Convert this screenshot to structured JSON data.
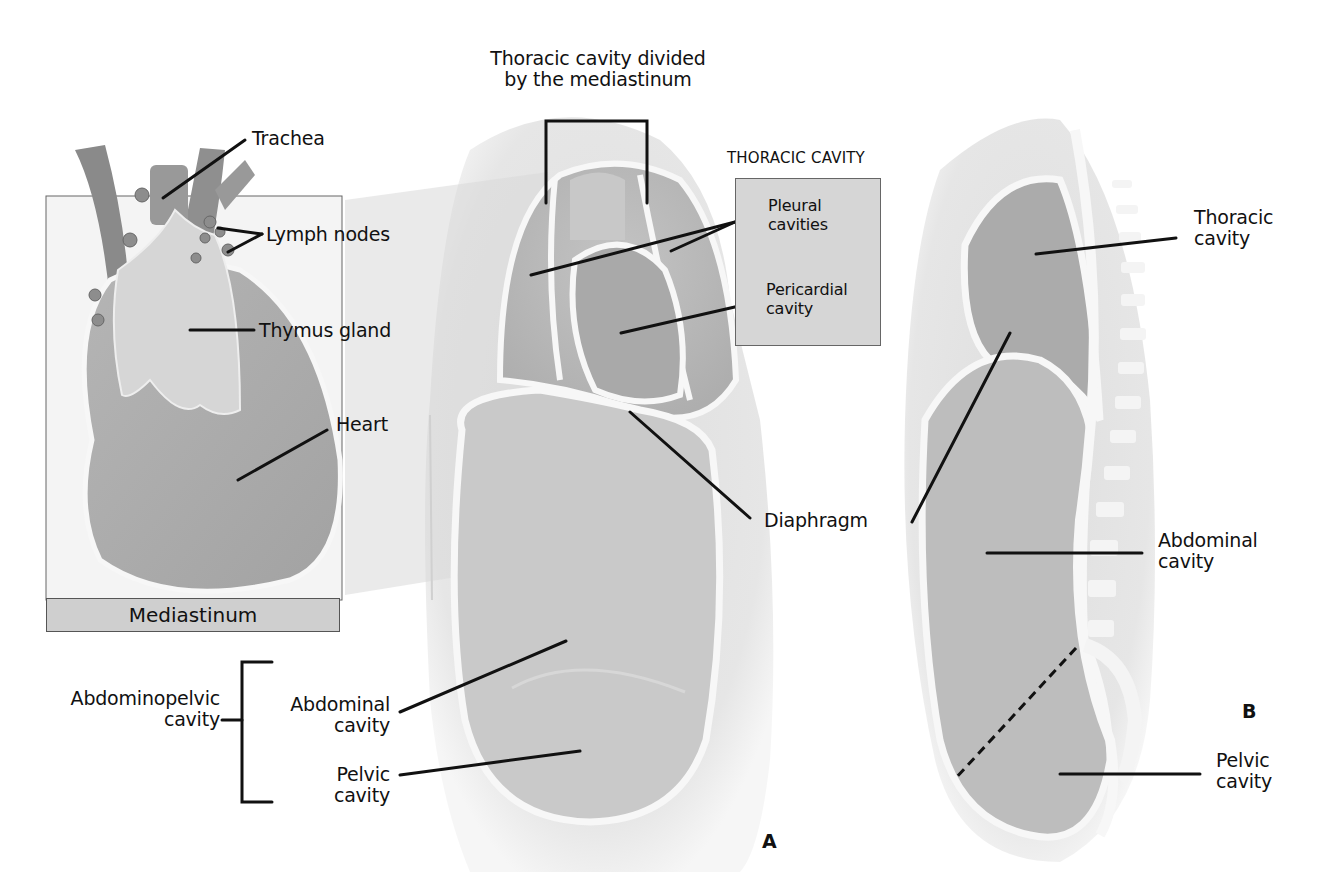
{
  "figure": {
    "panel_a_letter": "A",
    "panel_b_letter": "B"
  },
  "mediastinum_inset": {
    "labels": {
      "trachea": "Trachea",
      "lymph_nodes": "Lymph nodes",
      "thymus_gland": "Thymus gland",
      "heart": "Heart"
    },
    "footer_bar": "Mediastinum"
  },
  "panel_a": {
    "top_caption_line1": "Thoracic cavity divided",
    "top_caption_line2": "by the mediastinum",
    "thoracic_box_title": "THORACIC CAVITY",
    "pleural_line1": "Pleural",
    "pleural_line2": "cavities",
    "pericardial_line1": "Pericardial",
    "pericardial_line2": "cavity",
    "diaphragm": "Diaphragm",
    "abdominopelvic_line1": "Abdominopelvic",
    "abdominopelvic_line2": "cavity",
    "abdominal_line1": "Abdominal",
    "abdominal_line2": "cavity",
    "pelvic_line1": "Pelvic",
    "pelvic_line2": "cavity"
  },
  "panel_b": {
    "thoracic_line1": "Thoracic",
    "thoracic_line2": "cavity",
    "abdominal_line1": "Abdominal",
    "abdominal_line2": "cavity",
    "pelvic_line1": "Pelvic",
    "pelvic_line2": "cavity"
  },
  "colors": {
    "background": "#ffffff",
    "body_fill": "#e4e4e4",
    "cavity_fill": "#b9b9b9",
    "cavity_dark": "#a8a8a8",
    "membrane": "#f7f7f7",
    "leader": "#111111",
    "label_box": "#d6d6d6"
  }
}
